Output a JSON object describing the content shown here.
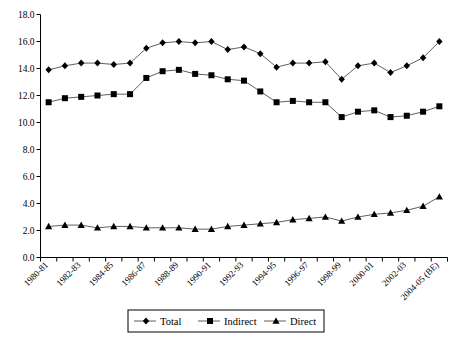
{
  "chart_data": {
    "type": "line",
    "title": "",
    "subtitle": "",
    "xlabel": "",
    "ylabel": "",
    "ylim": [
      0.0,
      18.0
    ],
    "ytick_step": 2.0,
    "ytick_labels": [
      "0.0",
      "2.0",
      "4.0",
      "6.0",
      "8.0",
      "10.0",
      "12.0",
      "14.0",
      "16.0",
      "18.0"
    ],
    "grid": false,
    "legend_position": "bottom-center",
    "categories": [
      "1980-81",
      "1981-82",
      "1982-83",
      "1983-84",
      "1984-85",
      "1985-86",
      "1986-87",
      "1987-88",
      "1988-89",
      "1989-90",
      "1990-91",
      "1991-92",
      "1992-93",
      "1993-94",
      "1994-95",
      "1995-96",
      "1996-97",
      "1997-98",
      "1998-99",
      "1999-2000",
      "2000-01",
      "2001-02",
      "2002-03",
      "2003-04",
      "2004-05 (BE)"
    ],
    "xtick_labels_shown": [
      "1980-81",
      "1982-83",
      "1984-85",
      "1986-87",
      "1988-89",
      "1990-91",
      "1992-93",
      "1994-95",
      "1996-97",
      "1998-99",
      "2000-01",
      "2002-03",
      "2004-05 (BE)"
    ],
    "series": [
      {
        "name": "Total",
        "marker": "diamond",
        "values": [
          13.9,
          14.2,
          14.4,
          14.4,
          14.3,
          14.4,
          15.5,
          15.9,
          16.0,
          15.9,
          16.0,
          15.4,
          15.6,
          15.1,
          14.1,
          14.4,
          14.4,
          14.5,
          13.2,
          14.2,
          14.4,
          13.7,
          14.2,
          14.8,
          16.0
        ]
      },
      {
        "name": "Indirect",
        "marker": "square",
        "values": [
          11.5,
          11.8,
          11.9,
          12.0,
          12.1,
          12.1,
          13.3,
          13.8,
          13.9,
          13.6,
          13.5,
          13.2,
          13.1,
          12.3,
          11.5,
          11.6,
          11.5,
          11.5,
          10.4,
          10.8,
          10.9,
          10.4,
          10.5,
          10.8,
          11.2
        ]
      },
      {
        "name": "Direct",
        "marker": "triangle",
        "values": [
          2.3,
          2.4,
          2.4,
          2.2,
          2.3,
          2.3,
          2.2,
          2.2,
          2.2,
          2.1,
          2.1,
          2.3,
          2.4,
          2.5,
          2.6,
          2.8,
          2.9,
          3.0,
          2.7,
          3.0,
          3.2,
          3.3,
          3.5,
          3.8,
          4.5
        ]
      }
    ]
  },
  "legend": {
    "items": [
      {
        "label": "Total",
        "marker": "diamond"
      },
      {
        "label": "Indirect",
        "marker": "square"
      },
      {
        "label": "Direct",
        "marker": "triangle"
      }
    ]
  }
}
